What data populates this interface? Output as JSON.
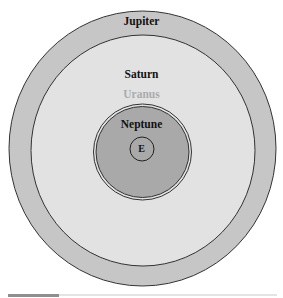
{
  "diagram": {
    "rings": [
      {
        "name": "Jupiter",
        "label": "Jupiter",
        "fill": "#c6c6c6",
        "label_color": "#111111"
      },
      {
        "name": "Saturn",
        "label": "Saturn",
        "fill": "#e2e2e2",
        "label_color": "#111111"
      },
      {
        "name": "Uranus",
        "label": "Uranus",
        "fill": "#e2e2e2",
        "label_color": "#ababab"
      },
      {
        "name": "Neptune",
        "label": "Neptune",
        "fill": "#a9a9a9",
        "label_color": "#111111"
      }
    ],
    "center": {
      "label": "E"
    }
  },
  "progress": {
    "percent": 19
  }
}
